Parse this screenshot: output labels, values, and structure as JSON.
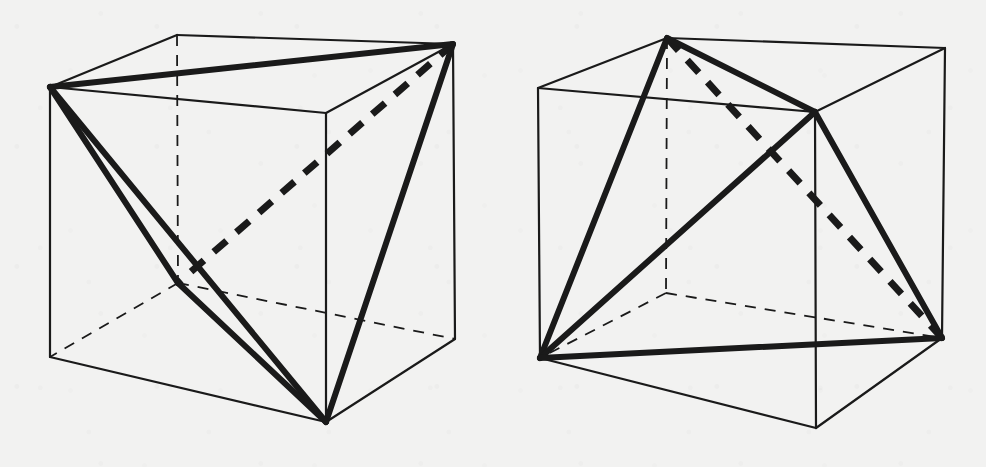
{
  "figure": {
    "background_color": "#f2f2f1",
    "ink_color": "#1a1a1a",
    "stroke_widths": {
      "cube_edge": 2.2,
      "hidden_edge": 1.8,
      "tetra_edge": 6.0,
      "tetra_hidden_edge": 7.0
    },
    "hidden_dash": "11 9",
    "tetra_hidden_dash": "17 13"
  },
  "panels": [
    {
      "id": "left-panel",
      "name": "left-figure",
      "caption": "",
      "cube": {
        "name": "cube-left",
        "vertices": {
          "front_top_left": [
            50,
            87
          ],
          "front_top_right": [
            326,
            113
          ],
          "front_bottom_left": [
            50,
            357
          ],
          "front_bottom_right": [
            326,
            422
          ],
          "back_top_left": [
            177,
            35
          ],
          "back_top_right": [
            453,
            44
          ],
          "back_bottom_left": [
            178,
            283
          ],
          "back_bottom_right": [
            455,
            339
          ]
        },
        "visible_edges": [
          [
            "front_top_left",
            "front_top_right"
          ],
          [
            "front_top_right",
            "front_bottom_right"
          ],
          [
            "front_bottom_right",
            "front_bottom_left"
          ],
          [
            "front_bottom_left",
            "front_top_left"
          ],
          [
            "front_top_left",
            "back_top_left"
          ],
          [
            "back_top_left",
            "back_top_right"
          ],
          [
            "back_top_right",
            "front_top_right"
          ],
          [
            "back_top_right",
            "back_bottom_right"
          ],
          [
            "back_bottom_right",
            "front_bottom_right"
          ]
        ],
        "hidden_edges": [
          [
            "back_top_left",
            "back_bottom_left"
          ],
          [
            "back_bottom_left",
            "back_bottom_right"
          ],
          [
            "back_bottom_left",
            "front_bottom_left"
          ]
        ]
      },
      "tetrahedron": {
        "name": "tetrahedron-left",
        "vertex_keys": [
          "front_top_left",
          "back_top_right",
          "front_bottom_right",
          "back_bottom_left"
        ],
        "solid_edges": [
          [
            "front_top_left",
            "back_top_right"
          ],
          [
            "front_top_left",
            "front_bottom_right"
          ],
          [
            "front_top_left",
            "back_bottom_left"
          ],
          [
            "back_top_right",
            "front_bottom_right"
          ],
          [
            "back_bottom_left",
            "front_bottom_right"
          ]
        ],
        "dashed_edges": [
          [
            "back_top_right",
            "back_bottom_left"
          ]
        ]
      }
    },
    {
      "id": "right-panel",
      "name": "right-figure",
      "caption": "",
      "cube": {
        "name": "cube-right",
        "vertices": {
          "front_top_left": [
            538,
            88
          ],
          "front_top_right": [
            815,
            112
          ],
          "front_bottom_left": [
            540,
            358
          ],
          "front_bottom_right": [
            816,
            428
          ],
          "back_top_left": [
            667,
            38
          ],
          "back_top_right": [
            945,
            48
          ],
          "back_bottom_left": [
            666,
            293
          ],
          "back_bottom_right": [
            942,
            338
          ]
        },
        "visible_edges": [
          [
            "front_top_left",
            "front_top_right"
          ],
          [
            "front_top_right",
            "front_bottom_right"
          ],
          [
            "front_bottom_right",
            "front_bottom_left"
          ],
          [
            "front_bottom_left",
            "front_top_left"
          ],
          [
            "front_top_left",
            "back_top_left"
          ],
          [
            "back_top_left",
            "back_top_right"
          ],
          [
            "back_top_right",
            "front_top_right"
          ],
          [
            "back_top_right",
            "back_bottom_right"
          ],
          [
            "back_bottom_right",
            "front_bottom_right"
          ]
        ],
        "hidden_edges": [
          [
            "back_top_left",
            "back_bottom_left"
          ],
          [
            "back_bottom_left",
            "back_bottom_right"
          ],
          [
            "back_bottom_left",
            "front_bottom_left"
          ]
        ]
      },
      "tetrahedron": {
        "name": "tetrahedron-right",
        "vertex_keys": [
          "back_top_left",
          "front_top_right",
          "front_bottom_left",
          "back_bottom_right"
        ],
        "solid_edges": [
          [
            "back_top_left",
            "front_top_right"
          ],
          [
            "back_top_left",
            "front_bottom_left"
          ],
          [
            "front_top_right",
            "front_bottom_left"
          ],
          [
            "front_top_right",
            "back_bottom_right"
          ],
          [
            "front_bottom_left",
            "back_bottom_right"
          ]
        ],
        "dashed_edges": [
          [
            "back_top_left",
            "back_bottom_right"
          ]
        ]
      }
    }
  ]
}
